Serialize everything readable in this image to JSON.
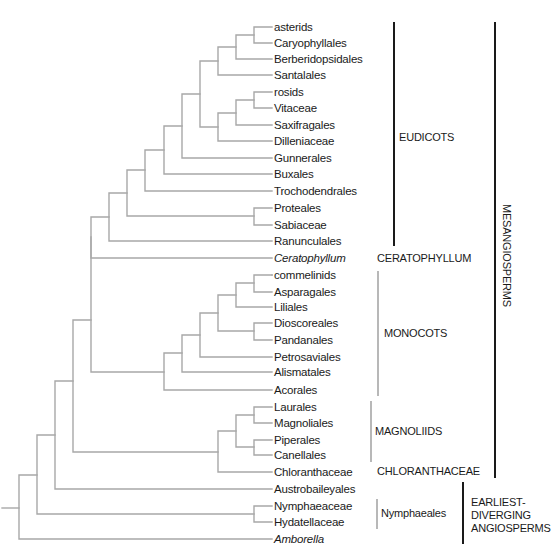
{
  "figure": {
    "type": "phylogenetic-tree",
    "branch_color": "#a8a8a8",
    "leaves": [
      {
        "label": "asterids",
        "italic": false
      },
      {
        "label": "Caryophyllales",
        "italic": false
      },
      {
        "label": "Berberidopsidales",
        "italic": false
      },
      {
        "label": "Santalales",
        "italic": false
      },
      {
        "label": "rosids",
        "italic": false
      },
      {
        "label": "Vitaceae",
        "italic": false
      },
      {
        "label": "Saxifragales",
        "italic": false
      },
      {
        "label": "Dilleniaceae",
        "italic": false
      },
      {
        "label": "Gunnerales",
        "italic": false
      },
      {
        "label": "Buxales",
        "italic": false
      },
      {
        "label": "Trochodendrales",
        "italic": false
      },
      {
        "label": "Proteales",
        "italic": false
      },
      {
        "label": "Sabiaceae",
        "italic": false
      },
      {
        "label": "Ranunculales",
        "italic": false
      },
      {
        "label": "Ceratophyllum",
        "italic": true
      },
      {
        "label": "commelinids",
        "italic": false
      },
      {
        "label": "Asparagales",
        "italic": false
      },
      {
        "label": "Liliales",
        "italic": false
      },
      {
        "label": "Dioscoreales",
        "italic": false
      },
      {
        "label": "Pandanales",
        "italic": false
      },
      {
        "label": "Petrosaviales",
        "italic": false
      },
      {
        "label": "Alismatales",
        "italic": false
      },
      {
        "label": "Acorales",
        "italic": false
      },
      {
        "label": "Laurales",
        "italic": false
      },
      {
        "label": "Magnoliales",
        "italic": false
      },
      {
        "label": "Piperales",
        "italic": false
      },
      {
        "label": "Canellales",
        "italic": false
      },
      {
        "label": "Chloranthaceae",
        "italic": false
      },
      {
        "label": "Austrobaileyales",
        "italic": false
      },
      {
        "label": "Nymphaeaceae",
        "italic": false
      },
      {
        "label": "Hydatellaceae",
        "italic": false
      },
      {
        "label": "Amborella",
        "italic": true
      }
    ],
    "groups": {
      "eudicots": "EUDICOTS",
      "ceratophyllum": "CERATOPHYLLUM",
      "monocots": "MONOCOTS",
      "magnoliids": "MAGNOLIIDS",
      "chloranthaceae": "CHLORANTHACEAE",
      "nymphaeales": "Nymphaeales",
      "mesangiosperms": "MESANGIOSPERMS",
      "earliest_line1": "EARLIEST-",
      "earliest_line2": "DIVERGING",
      "earliest_line3": "ANGIOSPERMS"
    }
  }
}
